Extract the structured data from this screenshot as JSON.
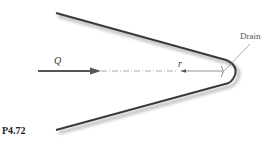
{
  "figure": {
    "labels": {
      "flow": "Q",
      "radius": "r",
      "drain": "Drain",
      "problem_number": "P4.72"
    },
    "colors": {
      "wall": "#3a3a3a",
      "arrow": "#555555",
      "text": "#333333"
    }
  }
}
